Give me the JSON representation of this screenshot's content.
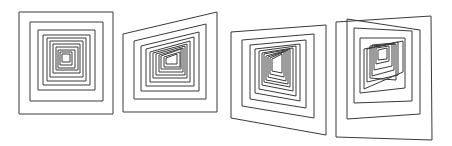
{
  "figure": {
    "stroke_color": "#3a3a3a",
    "background": "#ffffff"
  },
  "panels": [
    {
      "name": "panel-1-frontal",
      "quads": [
        [
          [
            19,
            12
          ],
          [
            113,
            12
          ],
          [
            113,
            114
          ],
          [
            19,
            114
          ]
        ],
        [
          [
            30,
            22
          ],
          [
            103,
            22
          ],
          [
            103,
            101
          ],
          [
            30,
            101
          ]
        ],
        [
          [
            38,
            30
          ],
          [
            95,
            30
          ],
          [
            95,
            90
          ],
          [
            38,
            90
          ]
        ],
        [
          [
            43,
            35
          ],
          [
            90,
            35
          ],
          [
            90,
            85
          ],
          [
            43,
            85
          ]
        ],
        [
          [
            47,
            38
          ],
          [
            86,
            38
          ],
          [
            86,
            81
          ],
          [
            47,
            81
          ]
        ],
        [
          [
            50,
            41
          ],
          [
            83,
            41
          ],
          [
            83,
            77
          ],
          [
            50,
            77
          ]
        ],
        [
          [
            53,
            44
          ],
          [
            80,
            44
          ],
          [
            80,
            73
          ],
          [
            53,
            73
          ]
        ],
        [
          [
            56,
            47
          ],
          [
            78,
            47
          ],
          [
            78,
            70
          ],
          [
            56,
            70
          ]
        ],
        [
          [
            58,
            50
          ],
          [
            75,
            50
          ],
          [
            75,
            68
          ],
          [
            58,
            68
          ]
        ],
        [
          [
            60,
            52
          ],
          [
            72,
            52
          ],
          [
            72,
            65
          ],
          [
            60,
            65
          ]
        ],
        [
          [
            62,
            54
          ],
          [
            70,
            54
          ],
          [
            70,
            62
          ],
          [
            62,
            62
          ]
        ]
      ]
    },
    {
      "name": "panel-2-slight-perspective",
      "quads": [
        [
          [
            123,
            34
          ],
          [
            217,
            12
          ],
          [
            217,
            112
          ],
          [
            123,
            112
          ]
        ],
        [
          [
            134,
            41
          ],
          [
            206,
            24
          ],
          [
            206,
            99
          ],
          [
            134,
            99
          ]
        ],
        [
          [
            141,
            46
          ],
          [
            199,
            32
          ],
          [
            199,
            91
          ],
          [
            141,
            91
          ]
        ],
        [
          [
            146,
            49
          ],
          [
            194,
            37
          ],
          [
            194,
            86
          ],
          [
            146,
            86
          ]
        ],
        [
          [
            150,
            52
          ],
          [
            190,
            41
          ],
          [
            190,
            82
          ],
          [
            150,
            82
          ]
        ],
        [
          [
            153,
            53
          ],
          [
            187,
            44
          ],
          [
            187,
            78
          ],
          [
            153,
            78
          ]
        ],
        [
          [
            156,
            54
          ],
          [
            185,
            46
          ],
          [
            185,
            75
          ],
          [
            156,
            75
          ]
        ],
        [
          [
            159,
            55
          ],
          [
            183,
            48
          ],
          [
            183,
            72
          ],
          [
            159,
            72
          ]
        ],
        [
          [
            161,
            56
          ],
          [
            181,
            49
          ],
          [
            181,
            69
          ],
          [
            161,
            69
          ]
        ],
        [
          [
            164,
            57
          ],
          [
            180,
            52
          ],
          [
            180,
            67
          ],
          [
            164,
            67
          ]
        ],
        [
          [
            166,
            58
          ],
          [
            177,
            54
          ],
          [
            177,
            64
          ],
          [
            166,
            64
          ]
        ]
      ]
    },
    {
      "name": "panel-3-moderate-perspective",
      "quads": [
        [
          [
            231,
            32
          ],
          [
            326,
            25
          ],
          [
            326,
            135
          ],
          [
            231,
            118
          ]
        ],
        [
          [
            242,
            40
          ],
          [
            314,
            34
          ],
          [
            314,
            118
          ],
          [
            242,
            106
          ]
        ],
        [
          [
            250,
            45
          ],
          [
            306,
            40
          ],
          [
            306,
            108
          ],
          [
            250,
            99
          ]
        ],
        [
          [
            255,
            49
          ],
          [
            300,
            44
          ],
          [
            300,
            101
          ],
          [
            255,
            93
          ]
        ],
        [
          [
            259,
            51
          ],
          [
            296,
            46
          ],
          [
            296,
            96
          ],
          [
            259,
            89
          ]
        ],
        [
          [
            262,
            53
          ],
          [
            293,
            48
          ],
          [
            293,
            91
          ],
          [
            262,
            85
          ]
        ],
        [
          [
            264,
            54
          ],
          [
            290,
            49
          ],
          [
            290,
            87
          ],
          [
            264,
            82
          ]
        ],
        [
          [
            266,
            56
          ],
          [
            288,
            50
          ],
          [
            288,
            84
          ],
          [
            266,
            80
          ]
        ],
        [
          [
            268,
            57
          ],
          [
            286,
            51
          ],
          [
            286,
            81
          ],
          [
            268,
            77
          ]
        ],
        [
          [
            270,
            58
          ],
          [
            284,
            52
          ],
          [
            284,
            77
          ],
          [
            270,
            74
          ]
        ],
        [
          [
            272,
            59
          ],
          [
            282,
            54
          ],
          [
            282,
            73
          ],
          [
            272,
            71
          ]
        ]
      ]
    },
    {
      "name": "panel-4-strong-perspective",
      "quads": [
        [
          [
            336,
            22
          ],
          [
            431,
            16
          ],
          [
            432,
            140
          ],
          [
            336,
            137
          ]
        ],
        [
          [
            347,
            19
          ],
          [
            420,
            30
          ],
          [
            420,
            114
          ],
          [
            347,
            119
          ]
        ],
        [
          [
            354,
            28
          ],
          [
            412,
            31
          ],
          [
            412,
            101
          ],
          [
            354,
            103
          ]
        ],
        [
          [
            360,
            38
          ],
          [
            405,
            38
          ],
          [
            405,
            88
          ],
          [
            360,
            93
          ]
        ],
        [
          [
            364,
            49
          ],
          [
            403,
            41
          ],
          [
            403,
            72
          ],
          [
            364,
            89
          ]
        ],
        [
          [
            367,
            49
          ],
          [
            398,
            42
          ],
          [
            398,
            75
          ],
          [
            367,
            82
          ]
        ],
        [
          [
            370,
            46
          ],
          [
            396,
            44
          ],
          [
            396,
            80
          ],
          [
            370,
            78
          ]
        ],
        [
          [
            372,
            45
          ],
          [
            394,
            43
          ],
          [
            394,
            70
          ],
          [
            372,
            76
          ]
        ],
        [
          [
            374,
            47
          ],
          [
            392,
            44
          ],
          [
            392,
            66
          ],
          [
            374,
            70
          ]
        ],
        [
          [
            376,
            48
          ],
          [
            389,
            46
          ],
          [
            389,
            61
          ],
          [
            376,
            64
          ]
        ],
        [
          [
            378,
            50
          ],
          [
            387,
            48
          ],
          [
            387,
            59
          ],
          [
            378,
            60
          ]
        ]
      ]
    }
  ]
}
